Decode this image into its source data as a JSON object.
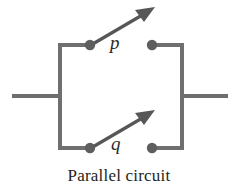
{
  "figure": {
    "caption": "Parallel circuit",
    "width": 238,
    "height": 196,
    "background_color": "#ffffff"
  },
  "colors": {
    "wire": "#6f6f6f",
    "node": "#5e5e5e",
    "switch_arm": "#575757",
    "label_text": "#2b2b2b",
    "caption_text": "#231f20"
  },
  "circuit": {
    "type": "parallel",
    "switches": [
      {
        "id": "switch-p",
        "label": "p",
        "branch": "top",
        "state": "open",
        "arrow_direction": "up-right"
      },
      {
        "id": "switch-q",
        "label": "q",
        "branch": "bottom",
        "state": "open",
        "arrow_direction": "up-right"
      }
    ],
    "terminals": [
      {
        "id": "terminal-left",
        "side": "left"
      },
      {
        "id": "terminal-right",
        "side": "right"
      }
    ],
    "nodes": [
      {
        "id": "node-top-left",
        "x": 90,
        "y": 45
      },
      {
        "id": "node-top-right",
        "x": 152,
        "y": 45
      },
      {
        "id": "node-bottom-left",
        "x": 90,
        "y": 148
      },
      {
        "id": "node-bottom-right",
        "x": 152,
        "y": 148
      }
    ]
  }
}
